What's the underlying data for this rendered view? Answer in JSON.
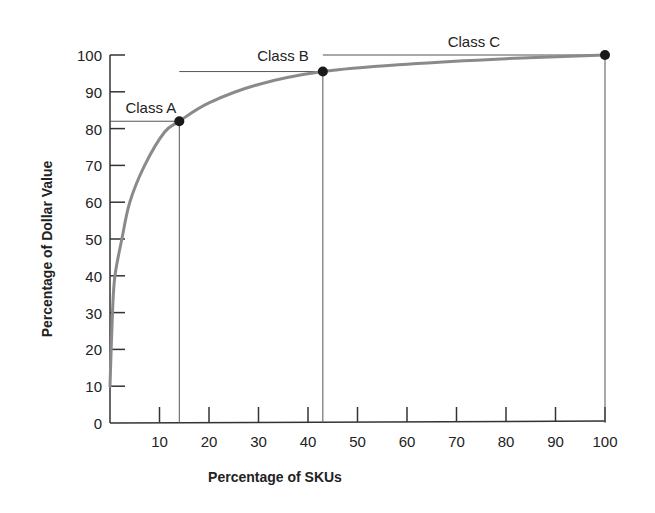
{
  "chart_data": {
    "type": "line",
    "title": "",
    "xlabel": "Percentage of SKUs",
    "ylabel": "Percentage of Dollar Value",
    "xlim": [
      0,
      100
    ],
    "ylim": [
      0,
      100
    ],
    "x_ticks": [
      10,
      20,
      30,
      40,
      50,
      60,
      70,
      80,
      90,
      100
    ],
    "y_ticks": [
      0,
      10,
      20,
      30,
      40,
      50,
      60,
      70,
      80,
      90,
      100
    ],
    "grid": false,
    "legend": "none",
    "series": [
      {
        "name": "Cumulative dollar value",
        "color": "#8a8a8a",
        "x": [
          0,
          0.5,
          1,
          2.4,
          4,
          7,
          11,
          14,
          20,
          30,
          43,
          60,
          80,
          100
        ],
        "y": [
          10,
          30,
          40,
          50,
          60,
          70,
          79,
          82,
          87,
          92,
          95.5,
          97.5,
          99,
          100
        ]
      }
    ],
    "class_boundaries": [
      {
        "label": "Class A",
        "x": 14,
        "y": 82
      },
      {
        "label": "Class B",
        "x": 43,
        "y": 95.5
      },
      {
        "label": "Class C",
        "x": 100,
        "y": 100
      }
    ],
    "annotations": [
      "Class A",
      "Class B",
      "Class C"
    ]
  }
}
